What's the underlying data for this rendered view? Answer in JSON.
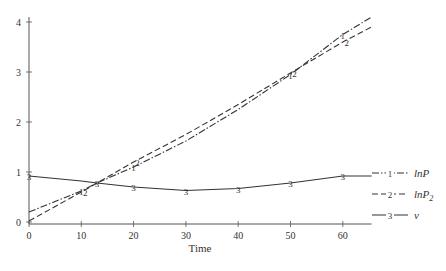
{
  "chart_data": {
    "type": "line",
    "title": "",
    "xlabel": "Time",
    "ylabel": "",
    "xlim": [
      0,
      65.5
    ],
    "ylim": [
      0,
      4.1
    ],
    "grid": false,
    "legend_position": "right",
    "x_ticks": [
      0,
      10,
      20,
      30,
      40,
      50,
      60
    ],
    "y_ticks": [
      0,
      1,
      2,
      3,
      4
    ],
    "series": [
      {
        "name": "lnP",
        "marker": "1",
        "style": "dash-dot",
        "x": [
          0,
          10,
          13,
          20,
          30,
          40,
          50,
          60,
          65.5
        ],
        "values": [
          0.2,
          0.62,
          0.78,
          1.1,
          1.62,
          2.25,
          2.95,
          3.75,
          4.1
        ]
      },
      {
        "name": "lnP2",
        "marker": "2",
        "style": "dashed",
        "x": [
          0,
          10,
          13,
          20,
          30,
          40,
          50,
          60,
          65.5
        ],
        "values": [
          0.02,
          0.6,
          0.78,
          1.2,
          1.75,
          2.35,
          2.98,
          3.6,
          3.9
        ]
      },
      {
        "name": "v",
        "marker": "3",
        "style": "solid",
        "x": [
          0,
          10,
          13,
          20,
          30,
          40,
          50,
          60,
          65.5
        ],
        "values": [
          0.92,
          0.82,
          0.78,
          0.7,
          0.63,
          0.67,
          0.78,
          0.92,
          0.92
        ]
      }
    ],
    "legend": [
      {
        "marker": "1",
        "label": "lnP",
        "style": "dash-dot"
      },
      {
        "marker": "2",
        "label": "lnP",
        "sub": "2",
        "style": "dashed"
      },
      {
        "marker": "3",
        "label": "v",
        "style": "solid"
      }
    ]
  }
}
